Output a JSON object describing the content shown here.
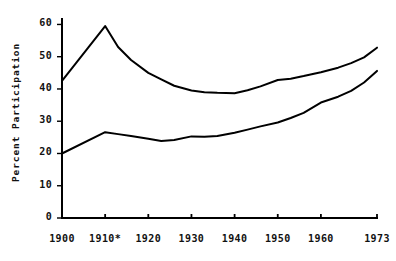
{
  "chart_data": {
    "type": "line",
    "title": "",
    "subtitle": "",
    "xlabel": "",
    "ylabel": "Percent Participation",
    "xlim": [
      1900,
      1973
    ],
    "ylim": [
      0,
      62
    ],
    "grid": false,
    "legend": "none",
    "xtick_labels": [
      "1900",
      "1910*",
      "1920",
      "1930",
      "1940",
      "1950",
      "1960",
      "1973"
    ],
    "xtick_values": [
      1900,
      1910,
      1920,
      1930,
      1940,
      1950,
      1960,
      1973
    ],
    "ytick_labels": [
      "0",
      "10",
      "20",
      "30",
      "40",
      "50",
      "60"
    ],
    "ytick_values": [
      0,
      10,
      20,
      30,
      40,
      50,
      60
    ],
    "annotations": [
      "* denotes break in series at 1910"
    ],
    "series": [
      {
        "name": "upper-curve",
        "x": [
          1900,
          1910,
          1913,
          1916,
          1920,
          1923,
          1926,
          1930,
          1933,
          1936,
          1940,
          1943,
          1946,
          1950,
          1953,
          1956,
          1960,
          1964,
          1967,
          1970,
          1973
        ],
        "values": [
          42.5,
          59.5,
          53.0,
          49.0,
          45.0,
          43.0,
          41.0,
          39.5,
          39.0,
          38.8,
          38.7,
          39.6,
          40.8,
          42.8,
          43.2,
          44.0,
          45.2,
          46.6,
          48.0,
          49.8,
          52.8
        ]
      },
      {
        "name": "lower-curve",
        "x": [
          1900,
          1910,
          1913,
          1916,
          1920,
          1923,
          1926,
          1930,
          1933,
          1936,
          1940,
          1943,
          1946,
          1950,
          1953,
          1956,
          1960,
          1964,
          1967,
          1970,
          1973
        ],
        "values": [
          20.0,
          26.6,
          26.0,
          25.4,
          24.6,
          23.9,
          24.2,
          25.3,
          25.2,
          25.4,
          26.4,
          27.4,
          28.4,
          29.6,
          31.0,
          32.6,
          35.8,
          37.6,
          39.4,
          42.0,
          45.6
        ]
      }
    ]
  },
  "style": {
    "line_color": "#000000",
    "axis_color": "#000000",
    "background": "#ffffff",
    "line_width": 2.0
  },
  "layout": {
    "plot_left_px": 62,
    "plot_right_px": 377,
    "plot_top_px": 18,
    "plot_bottom_px": 218
  }
}
